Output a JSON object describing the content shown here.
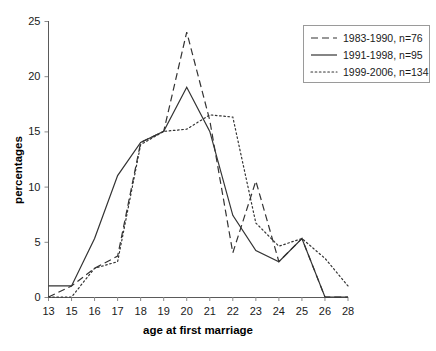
{
  "chart_data": {
    "type": "line",
    "title": "",
    "xlabel": "age at first marriage",
    "ylabel": "percentages",
    "categories": [
      "13",
      "15",
      "16",
      "17",
      "18",
      "19",
      "20",
      "21",
      "22",
      "23",
      "24",
      "25",
      "26",
      "28"
    ],
    "xlim": [
      0,
      13
    ],
    "ylim": [
      0,
      25
    ],
    "yticks": [
      0,
      5,
      10,
      15,
      20,
      25
    ],
    "grid": false,
    "legend_position": "top-right",
    "series": [
      {
        "name": "1983-1990, n=76",
        "style": "dashed",
        "color": "#333333",
        "values": [
          0,
          1,
          2.6,
          3.7,
          14,
          15,
          24,
          16,
          4,
          10.5,
          3.2,
          5.3,
          0,
          0
        ]
      },
      {
        "name": "1991-1998, n=95",
        "style": "solid",
        "color": "#333333",
        "values": [
          1,
          1,
          5.3,
          11,
          14,
          15,
          19,
          15,
          7.4,
          4.2,
          3.2,
          5.3,
          0,
          0
        ]
      },
      {
        "name": "1999-2006, n=134",
        "style": "dotted",
        "color": "#333333",
        "values": [
          0,
          0,
          2.6,
          3.2,
          13.8,
          15,
          15.2,
          16.5,
          16.3,
          6.7,
          4.6,
          5.3,
          3.5,
          1
        ]
      }
    ]
  },
  "axes": {
    "y_label": "percentages",
    "x_label": "age at first marriage",
    "y_tick_labels": [
      "0",
      "5",
      "10",
      "15",
      "20",
      "25"
    ],
    "x_tick_labels": [
      "13",
      "15",
      "16",
      "17",
      "18",
      "19",
      "20",
      "21",
      "22",
      "23",
      "24",
      "25",
      "26",
      "28"
    ]
  },
  "legend": {
    "entries": [
      {
        "label": "1983-1990, n=76",
        "style": "dashed"
      },
      {
        "label": "1991-1998, n=95",
        "style": "solid"
      },
      {
        "label": "1999-2006, n=134",
        "style": "dotted"
      }
    ]
  }
}
